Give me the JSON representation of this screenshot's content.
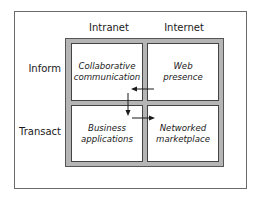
{
  "diagram": {
    "columns": [
      {
        "label": "Intranet"
      },
      {
        "label": "Internet"
      }
    ],
    "rows": [
      {
        "label": "Inform"
      },
      {
        "label": "Transact"
      }
    ],
    "cells": [
      {
        "row": 0,
        "col": 0,
        "line1": "Collaborative",
        "line2": "communication"
      },
      {
        "row": 0,
        "col": 1,
        "line1": "Web",
        "line2": "presence"
      },
      {
        "row": 1,
        "col": 0,
        "line1": "Business",
        "line2": "applications"
      },
      {
        "row": 1,
        "col": 1,
        "line1": "Networked",
        "line2": "marketplace"
      }
    ],
    "arrows": [
      {
        "from": "Web presence",
        "to": "Collaborative communication",
        "direction": "left"
      },
      {
        "from": "Collaborative communication",
        "to": "Business applications",
        "direction": "down"
      },
      {
        "from": "Business applications",
        "to": "Networked marketplace",
        "direction": "right"
      }
    ],
    "colors": {
      "grid_fill": "#b5b5b5",
      "border": "#444444",
      "frame": "#6b6b6b",
      "arrow": "#1a1a1a"
    }
  }
}
